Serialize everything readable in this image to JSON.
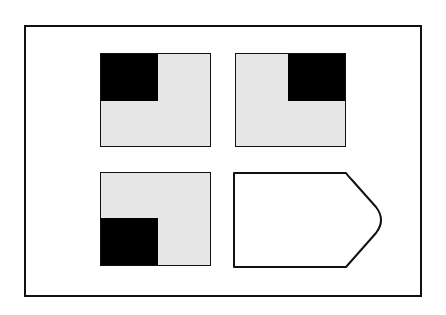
{
  "figure": {
    "colors": {
      "frame": "#111111",
      "panel_fill": "#e6e6e6",
      "quadrant_fill": "#000000",
      "background": "#ffffff"
    },
    "panels": [
      {
        "id": "panel-1",
        "position": "top-left",
        "black_quadrant": "top-left"
      },
      {
        "id": "panel-2",
        "position": "top-right",
        "black_quadrant": "top-right"
      },
      {
        "id": "panel-3",
        "position": "bottom-left",
        "black_quadrant": "bottom-left"
      }
    ],
    "answer_shape": {
      "position": "bottom-right",
      "shape": "arrow-pentagon",
      "fill": "#ffffff"
    }
  }
}
